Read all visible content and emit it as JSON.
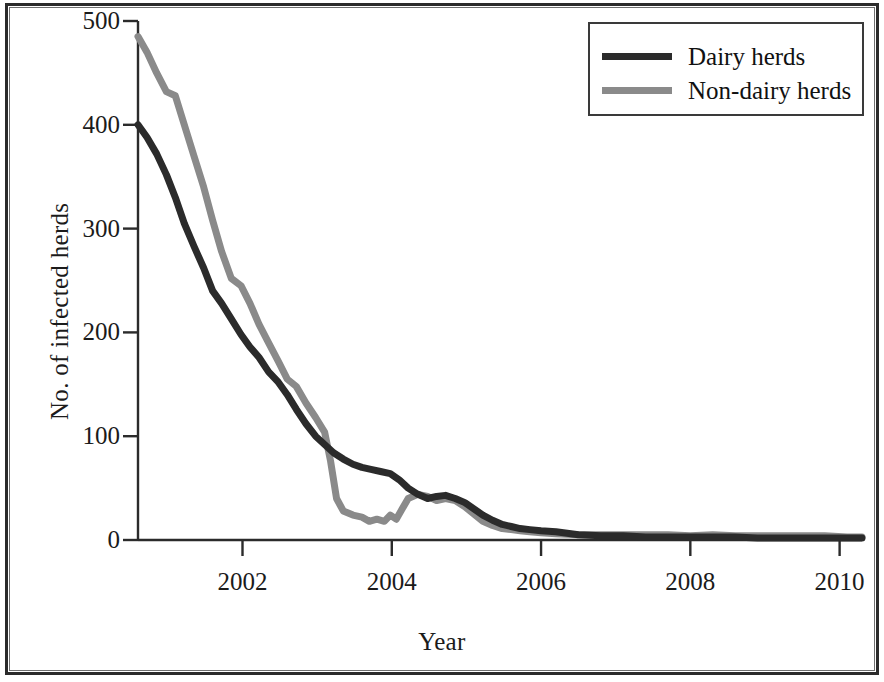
{
  "chart_data": {
    "type": "line",
    "title": "",
    "xlabel": "Year",
    "ylabel": "No. of infected herds",
    "xlim": [
      2000.6,
      2010.3
    ],
    "ylim": [
      0,
      500
    ],
    "xticks": [
      2002,
      2004,
      2006,
      2008,
      2010
    ],
    "xticklabels": [
      "2002",
      "2004",
      "2006",
      "2008",
      "2010"
    ],
    "yticks": [
      0,
      100,
      200,
      300,
      400,
      500
    ],
    "yticklabels": [
      "0",
      "100",
      "200",
      "300",
      "400",
      "500"
    ],
    "grid": false,
    "legend_position": "top-right",
    "series": [
      {
        "name": "Dairy herds",
        "color": "#2b2b2b",
        "x": [
          2000.6,
          2000.72,
          2000.85,
          2000.98,
          2001.1,
          2001.22,
          2001.35,
          2001.48,
          2001.6,
          2001.72,
          2001.85,
          2001.98,
          2002.1,
          2002.22,
          2002.35,
          2002.48,
          2002.6,
          2002.72,
          2002.85,
          2002.98,
          2003.1,
          2003.22,
          2003.35,
          2003.48,
          2003.6,
          2003.72,
          2003.85,
          2003.98,
          2004.1,
          2004.22,
          2004.35,
          2004.48,
          2004.6,
          2004.72,
          2004.85,
          2004.98,
          2005.1,
          2005.22,
          2005.35,
          2005.48,
          2005.6,
          2005.72,
          2005.85,
          2006.0,
          2006.2,
          2006.5,
          2006.8,
          2007.1,
          2007.4,
          2007.7,
          2008.0,
          2008.3,
          2008.6,
          2008.9,
          2009.2,
          2009.5,
          2009.8,
          2010.1,
          2010.3
        ],
        "y": [
          400,
          388,
          372,
          352,
          330,
          305,
          283,
          262,
          240,
          228,
          213,
          198,
          186,
          176,
          162,
          152,
          140,
          126,
          112,
          100,
          92,
          84,
          78,
          73,
          70,
          68,
          66,
          64,
          58,
          50,
          44,
          40,
          42,
          43,
          40,
          36,
          30,
          24,
          19,
          15,
          13,
          11,
          10,
          9,
          8,
          5,
          4,
          4,
          3,
          3,
          3,
          3,
          3,
          2,
          2,
          2,
          2,
          2,
          2
        ]
      },
      {
        "name": "Non-dairy herds",
        "color": "#8a8a8a",
        "x": [
          2000.6,
          2000.72,
          2000.85,
          2000.98,
          2001.1,
          2001.22,
          2001.35,
          2001.48,
          2001.6,
          2001.72,
          2001.85,
          2001.98,
          2002.1,
          2002.22,
          2002.35,
          2002.48,
          2002.6,
          2002.72,
          2002.85,
          2002.98,
          2003.1,
          2003.18,
          2003.26,
          2003.35,
          2003.48,
          2003.6,
          2003.7,
          2003.8,
          2003.9,
          2003.98,
          2004.06,
          2004.14,
          2004.22,
          2004.35,
          2004.48,
          2004.6,
          2004.72,
          2004.85,
          2004.98,
          2005.1,
          2005.22,
          2005.35,
          2005.48,
          2005.6,
          2005.72,
          2005.85,
          2006.0,
          2006.2,
          2006.5,
          2006.8,
          2007.1,
          2007.4,
          2007.7,
          2008.0,
          2008.3,
          2008.6,
          2008.9,
          2009.2,
          2009.5,
          2009.8,
          2010.1,
          2010.3
        ],
        "y": [
          485,
          470,
          450,
          432,
          428,
          400,
          370,
          340,
          308,
          278,
          252,
          245,
          228,
          208,
          190,
          172,
          155,
          148,
          132,
          118,
          104,
          76,
          40,
          28,
          24,
          22,
          18,
          20,
          18,
          24,
          20,
          30,
          40,
          44,
          42,
          38,
          40,
          38,
          32,
          25,
          18,
          14,
          11,
          10,
          9,
          8,
          7,
          6,
          5,
          5,
          5,
          5,
          5,
          4,
          5,
          4,
          4,
          4,
          4,
          4,
          3,
          3
        ]
      }
    ]
  },
  "legend": {
    "items": [
      {
        "label": "Dairy herds",
        "color": "#2b2b2b"
      },
      {
        "label": "Non-dairy herds",
        "color": "#8a8a8a"
      }
    ]
  }
}
